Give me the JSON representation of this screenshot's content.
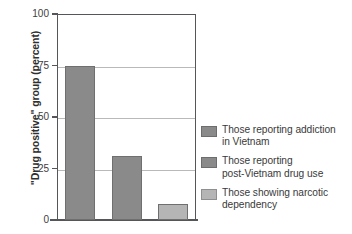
{
  "chart_data": {
    "type": "bar",
    "title": "",
    "xlabel": "",
    "ylabel": "\"Drug positive\" group (percent)",
    "ylim": [
      0,
      100
    ],
    "yticks": [
      "0",
      "25",
      "50",
      "75",
      "100"
    ],
    "ytick_values": [
      0,
      25,
      50,
      75,
      100
    ],
    "grid": "horizontal",
    "legend_position": "right",
    "categories": [
      "Those reporting addiction in Vietnam",
      "Those reporting post-Vietnam drug use",
      "Those showing narcotic dependency"
    ],
    "values": [
      75,
      31,
      8
    ],
    "colors": [
      "#8a8a8a",
      "#8a8a8a",
      "#b5b5b5"
    ]
  },
  "legend": {
    "items": [
      {
        "line1": "Those reporting addiction",
        "line2": "in Vietnam",
        "color": "#8a8a8a",
        "border": "#6d6d6d"
      },
      {
        "line1": "Those reporting",
        "line2": "post-Vietnam drug use",
        "color": "#8a8a8a",
        "border": "#6d6d6d"
      },
      {
        "line1": "Those showing narcotic",
        "line2": "dependency",
        "color": "#b5b5b5",
        "border": "#8f8f8f"
      }
    ]
  },
  "axis": {
    "frame_color": "#55565a",
    "grid_color": "#b9b9b9",
    "bar_border_color": "#6f6f6f"
  }
}
